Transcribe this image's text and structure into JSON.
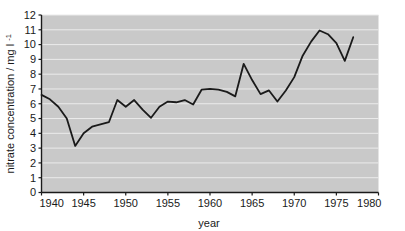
{
  "chart_data": {
    "type": "line",
    "title": "",
    "xlabel": "year",
    "ylabel": "nitrate concentration / mg l",
    "ylabel_superscript": "-1",
    "xlim": [
      1940,
      1980
    ],
    "ylim": [
      0,
      12
    ],
    "xticks": [
      1940,
      1945,
      1950,
      1955,
      1960,
      1965,
      1970,
      1975,
      1980
    ],
    "yticks": [
      0,
      1,
      2,
      3,
      4,
      5,
      6,
      7,
      8,
      9,
      10,
      11,
      12
    ],
    "xtick_labels": [
      "1940",
      "1945",
      "1950",
      "1955",
      "1960",
      "1965",
      "1970",
      "1975",
      "1980"
    ],
    "ytick_labels": [
      "0",
      "1",
      "2",
      "3",
      "4",
      "5",
      "6",
      "7",
      "8",
      "9",
      "10",
      "11",
      "12"
    ],
    "grid": "horizontal",
    "legend": "none",
    "plot_background": "#c9c9c9",
    "grid_color": "#ebebeb",
    "line_color": "#1a1a1a",
    "axis_color": "#1a1a1a",
    "line_width": 1.8,
    "x": [
      1940,
      1941,
      1942,
      1943,
      1944,
      1945,
      1946,
      1947,
      1948,
      1949,
      1950,
      1951,
      1952,
      1953,
      1954,
      1955,
      1956,
      1957,
      1958,
      1959,
      1960,
      1961,
      1962,
      1963,
      1964,
      1965,
      1966,
      1967,
      1968,
      1969,
      1970,
      1971,
      1972,
      1973,
      1974,
      1975,
      1976,
      1977
    ],
    "values": [
      6.6,
      6.3,
      5.8,
      5.0,
      3.15,
      4.0,
      4.45,
      4.6,
      4.75,
      6.25,
      5.8,
      6.25,
      5.6,
      5.05,
      5.8,
      6.15,
      6.1,
      6.25,
      5.95,
      6.95,
      7.0,
      6.95,
      6.8,
      6.5,
      8.7,
      7.6,
      6.65,
      6.9,
      6.15,
      6.9,
      7.8,
      9.25,
      10.2,
      10.95,
      10.7,
      10.1,
      8.9,
      10.5
    ],
    "series_name": "nitrate concentration"
  },
  "figure": {
    "background": "#ffffff",
    "width": 405,
    "height": 231
  }
}
